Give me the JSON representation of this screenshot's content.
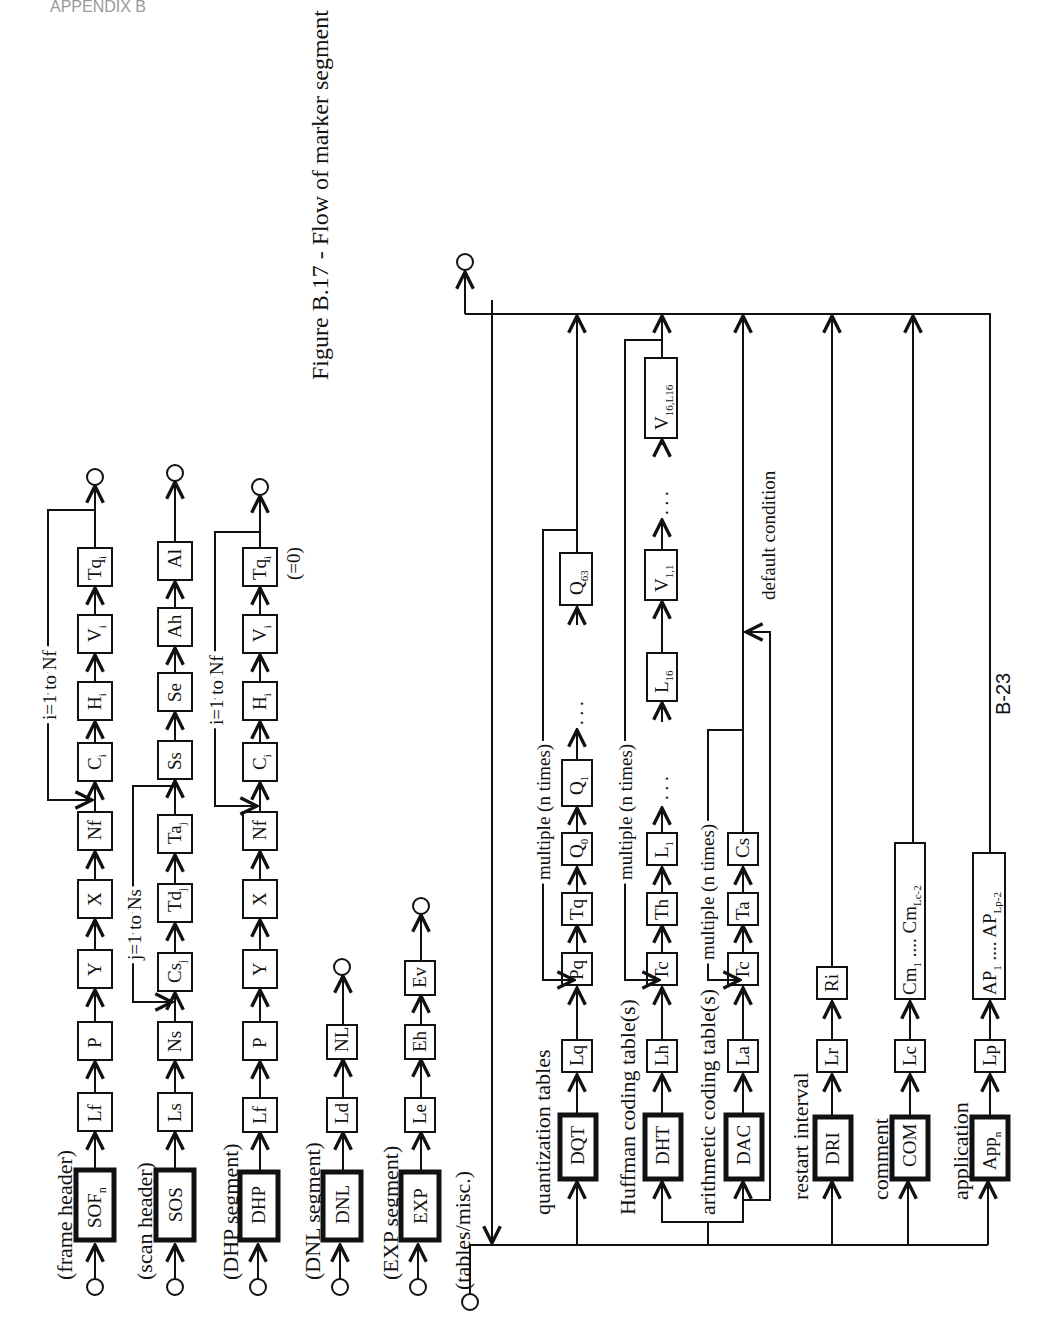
{
  "header": {
    "text": "APPENDIX B"
  },
  "figure": {
    "caption": "Figure B.17 - Flow of marker segment"
  },
  "page_number": "B-23",
  "rows": {
    "frame_header": {
      "label": "(frame header)",
      "marker": "SOF",
      "marker_sub": "n",
      "fields": [
        "Lf",
        "P",
        "Y",
        "X",
        "Nf"
      ],
      "loop_label": "i=1 to Nf",
      "loop_fields": [
        {
          "base": "C",
          "sub": "i"
        },
        {
          "base": "H",
          "sub": "i"
        },
        {
          "base": "V",
          "sub": "i"
        },
        {
          "base": "Tq",
          "sub": "i"
        }
      ]
    },
    "scan_header": {
      "label": "(scan header)",
      "marker": "SOS",
      "fields": [
        "Ls",
        "Ns"
      ],
      "loop_label": "j=1 to Ns",
      "loop_fields": [
        {
          "base": "Cs",
          "sub": "j"
        },
        {
          "base": "Td",
          "sub": "j"
        },
        {
          "base": "Ta",
          "sub": "j"
        }
      ],
      "tail_fields": [
        "Ss",
        "Se",
        "Ah",
        "Al"
      ]
    },
    "dhp_segment": {
      "label": "(DHP segment)",
      "marker": "DHP",
      "fields": [
        "Lf",
        "P",
        "Y",
        "X",
        "Nf"
      ],
      "loop_label": "i=1 to Nf",
      "loop_fields": [
        {
          "base": "C",
          "sub": "i"
        },
        {
          "base": "H",
          "sub": "i"
        },
        {
          "base": "V",
          "sub": "i"
        },
        {
          "base": "Tq",
          "sub": "i"
        }
      ],
      "note": "(=0)"
    },
    "dnl_segment": {
      "label": "(DNL segment)",
      "marker": "DNL",
      "fields": [
        "Ld",
        "NL"
      ]
    },
    "exp_segment": {
      "label": "(EXP segment)",
      "marker": "EXP",
      "fields": [
        "Le",
        "Eh",
        "Ev"
      ]
    },
    "tables_misc": {
      "label": "(tables/misc.)",
      "quantization": {
        "label": "quantization tables",
        "marker": "DQT",
        "fields": [
          "Lq",
          "Pq",
          "Tq"
        ],
        "repeat_label": "multiple (n times)",
        "values": [
          {
            "base": "Q",
            "sub": "0"
          },
          {
            "base": "Q",
            "sub": "1"
          },
          {
            "base": "Q",
            "sub": "63"
          }
        ]
      },
      "huffman": {
        "label": "Huffman coding table(s)",
        "marker": "DHT",
        "fields": [
          "Lh",
          "Tc",
          "Th"
        ],
        "repeat_label": "multiple (n times)",
        "values": [
          {
            "base": "L",
            "sub": "1"
          },
          {
            "base": "L",
            "sub": "16"
          },
          {
            "base": "V",
            "sub": "1,1"
          },
          {
            "base": "V",
            "sub": "16,L16"
          }
        ]
      },
      "arithmetic": {
        "label": "arithmetic coding table(s)",
        "marker": "DAC",
        "fields": [
          "La",
          "Tc",
          "Ta",
          "Cs"
        ],
        "repeat_label": "multiple (n times)",
        "default_label": "default  condition"
      },
      "restart": {
        "label": "restart interval",
        "marker": "DRI",
        "fields": [
          "Lr",
          "Ri"
        ]
      },
      "comment": {
        "label": "comment",
        "marker": "COM",
        "fields": [
          "Lc"
        ],
        "data": {
          "first": "Cm",
          "first_sub": "1",
          "dots": " .... ",
          "last": "Cm",
          "last_sub": "Lc-2"
        }
      },
      "application": {
        "label": "application",
        "marker": "App",
        "marker_sub": "n",
        "fields": [
          "Lp"
        ],
        "data": {
          "first": "AP",
          "first_sub": "1",
          "dots": " .... ",
          "last": "AP",
          "last_sub": "Lp-2"
        }
      }
    }
  },
  "symbols": {
    "ellipsis": ". . .",
    "terminal": "circle"
  }
}
